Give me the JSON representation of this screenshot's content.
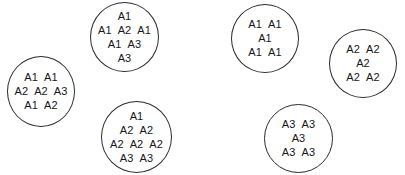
{
  "diagram": {
    "type": "set-membership-diagram",
    "background_color": "#ffffff",
    "outline_color": "#2a2a33",
    "text_color": "#15151a",
    "groups": [
      {
        "id": "group-1",
        "name": "left-group",
        "rows": [
          [
            "A1",
            "A1"
          ],
          [
            "A2",
            "A2",
            "A3"
          ],
          [
            "A1",
            "A2"
          ]
        ]
      },
      {
        "id": "group-2",
        "name": "top-center-group",
        "rows": [
          [
            "A1"
          ],
          [
            "A1",
            "A2",
            "A1"
          ],
          [
            "A1",
            "A3"
          ],
          [
            "A3"
          ]
        ]
      },
      {
        "id": "group-3",
        "name": "bottom-center-group",
        "rows": [
          [
            "A1"
          ],
          [
            "A2",
            "A2"
          ],
          [
            "A2",
            "A2",
            "A2"
          ],
          [
            "A3",
            "A3"
          ]
        ]
      },
      {
        "id": "group-4",
        "name": "top-right-group",
        "rows": [
          [
            "A1",
            "A1"
          ],
          [
            "A1"
          ],
          [
            "A1",
            "A1"
          ]
        ]
      },
      {
        "id": "group-5",
        "name": "far-right-group",
        "rows": [
          [
            "A2",
            "A2"
          ],
          [
            "A2"
          ],
          [
            "A2",
            "A2"
          ]
        ]
      },
      {
        "id": "group-6",
        "name": "bottom-right-group",
        "rows": [
          [
            "A3",
            "A3"
          ],
          [
            "A3"
          ],
          [
            "A3",
            "A3"
          ]
        ]
      }
    ]
  }
}
